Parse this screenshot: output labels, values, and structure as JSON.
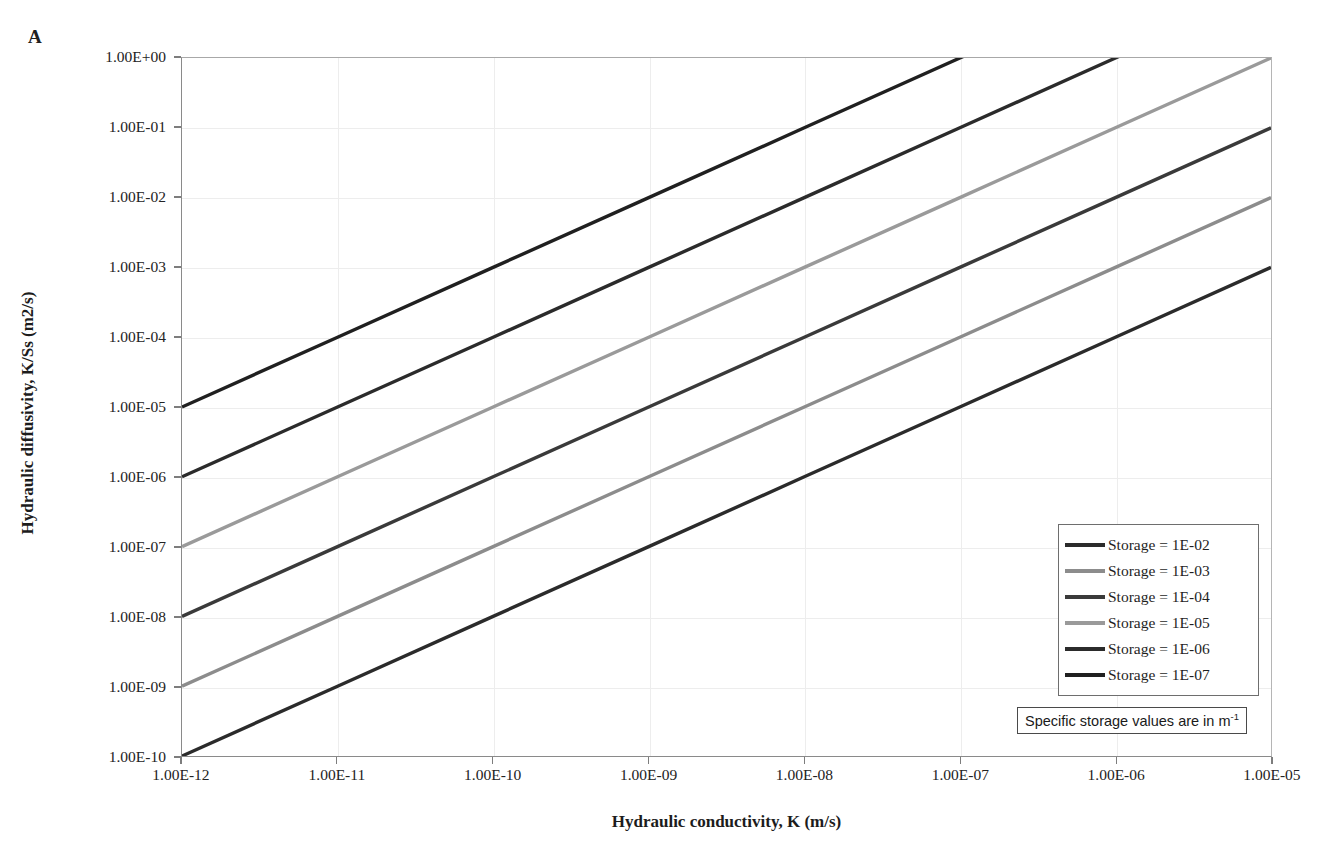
{
  "panel": {
    "label": "A"
  },
  "axes": {
    "x_title": "Hydraulic conductivity, K (m/s)",
    "y_title": "Hydraulic diffusivity, K/Ss (m2/s)"
  },
  "note": {
    "text_before": "Specific storage values are in m",
    "exponent": "-1",
    "full_text": "Specific storage values are in m-1"
  },
  "legend": {
    "items": [
      {
        "label": "Storage = 1E-02",
        "color": "#2b2b2b",
        "storage": 0.01
      },
      {
        "label": "Storage = 1E-03",
        "color": "#8c8c8c",
        "storage": 0.001
      },
      {
        "label": "Storage = 1E-04",
        "color": "#3a3a3a",
        "storage": 0.0001
      },
      {
        "label": "Storage = 1E-05",
        "color": "#9a9a9a",
        "storage": 1e-05
      },
      {
        "label": "Storage = 1E-06",
        "color": "#2b2b2b",
        "storage": 1e-06
      },
      {
        "label": "Storage = 1E-07",
        "color": "#202020",
        "storage": 1e-07
      }
    ]
  },
  "chart_data": {
    "type": "line",
    "title": "",
    "xlabel": "Hydraulic conductivity, K (m/s)",
    "ylabel": "Hydraulic diffusivity, K/Ss (m2/s)",
    "xscale": "log",
    "yscale": "log",
    "xlim": [
      1e-12,
      1e-05
    ],
    "ylim": [
      1e-10,
      1.0
    ],
    "grid": true,
    "legend_position": "inside-bottom-right",
    "x_tick_labels": [
      "1.00E-12",
      "1.00E-11",
      "1.00E-10",
      "1.00E-09",
      "1.00E-08",
      "1.00E-07",
      "1.00E-06",
      "1.00E-05"
    ],
    "x": [
      1e-12,
      1e-11,
      1e-10,
      1e-09,
      1e-08,
      1e-07,
      1e-06,
      1e-05
    ],
    "y_tick_labels": [
      "1.00E+00",
      "1.00E-01",
      "1.00E-02",
      "1.00E-03",
      "1.00E-04",
      "1.00E-05",
      "1.00E-06",
      "1.00E-07",
      "1.00E-08",
      "1.00E-09",
      "1.00E-10"
    ],
    "y_ticks": [
      1.0,
      0.1,
      0.01,
      0.001,
      0.0001,
      1e-05,
      1e-06,
      1e-07,
      1e-08,
      1e-09,
      1e-10
    ],
    "series": [
      {
        "name": "Storage = 1E-02",
        "color": "#2b2b2b",
        "values": [
          1e-10,
          1e-09,
          1e-08,
          1e-07,
          1e-06,
          1e-05,
          0.0001,
          0.001
        ]
      },
      {
        "name": "Storage = 1E-03",
        "color": "#8c8c8c",
        "values": [
          1e-09,
          1e-08,
          1e-07,
          1e-06,
          1e-05,
          0.0001,
          0.001,
          0.01
        ]
      },
      {
        "name": "Storage = 1E-04",
        "color": "#3a3a3a",
        "values": [
          1e-08,
          1e-07,
          1e-06,
          1e-05,
          0.0001,
          0.001,
          0.01,
          0.1
        ]
      },
      {
        "name": "Storage = 1E-05",
        "color": "#9a9a9a",
        "values": [
          1e-07,
          1e-06,
          1e-05,
          0.0001,
          0.001,
          0.01,
          0.1,
          1.0
        ]
      },
      {
        "name": "Storage = 1E-06",
        "color": "#2b2b2b",
        "values": [
          1e-06,
          1e-05,
          0.0001,
          0.001,
          0.01,
          0.1,
          1.0,
          10.0
        ]
      },
      {
        "name": "Storage = 1E-07",
        "color": "#202020",
        "values": [
          1e-05,
          0.0001,
          0.001,
          0.01,
          0.1,
          1.0,
          10.0,
          100.0
        ]
      }
    ]
  }
}
